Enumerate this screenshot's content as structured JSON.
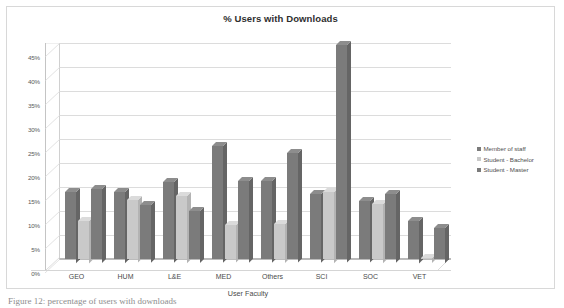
{
  "chart_data": {
    "type": "bar",
    "title": "% Users with Downloads",
    "xlabel": "User Faculty",
    "ylabel": "",
    "categories": [
      "GEO",
      "HUM",
      "L&E",
      "MED",
      "Others",
      "SCI",
      "SOC",
      "VET"
    ],
    "series": [
      {
        "name": "Member of staff",
        "color": "#7b7b7b",
        "values": [
          14.0,
          14.0,
          16.0,
          23.5,
          16.2,
          13.5,
          12.0,
          8.0
        ]
      },
      {
        "name": "Student - Bachelor",
        "color": "#c9c9c9",
        "values": [
          8.0,
          12.2,
          13.2,
          7.0,
          7.3,
          14.0,
          11.5,
          0.2
        ]
      },
      {
        "name": "Student - Master",
        "color": "#7b7b7b",
        "values": [
          14.6,
          11.2,
          10.0,
          16.2,
          22.0,
          44.5,
          13.5,
          6.5
        ]
      }
    ],
    "ylim": [
      0,
      45
    ],
    "ytick_values": [
      0,
      5,
      10,
      15,
      20,
      25,
      30,
      35,
      40,
      45
    ],
    "ytick_labels": [
      "0%",
      "5%",
      "10%",
      "15%",
      "20%",
      "25%",
      "30%",
      "35%",
      "40%",
      "45%"
    ],
    "grid": true,
    "legend_position": "right",
    "style": "3d-clustered-column"
  },
  "caption": {
    "text": "Figure 12: percentage of users with downloads"
  }
}
